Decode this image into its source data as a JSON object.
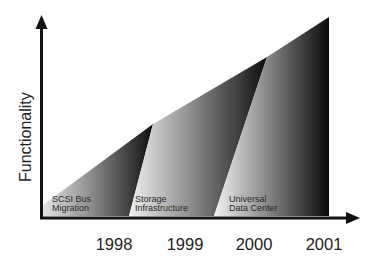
{
  "diagram": {
    "y_axis_label": "Functionality",
    "x_axis_ticks": [
      "1998",
      "1999",
      "2000",
      "2001"
    ],
    "phases": [
      {
        "line1": "SCSI Bus",
        "line2": "Migration"
      },
      {
        "line1": "Storage",
        "line2": "Infrastructure"
      },
      {
        "line1": "Universal",
        "line2": "Data Center"
      }
    ],
    "colors": {
      "axis": "#111111",
      "wedge_light": "#e6e6e6",
      "wedge_dark": "#111111",
      "background": "#ffffff"
    }
  }
}
